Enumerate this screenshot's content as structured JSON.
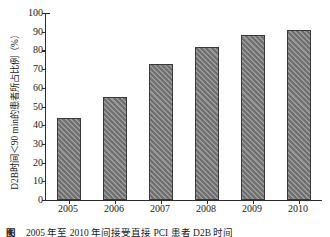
{
  "chart_data": {
    "type": "bar",
    "title": "",
    "xlabel": "",
    "ylabel": "D2B时间＜90 min的患者所占比例（%）",
    "categories": [
      "2005",
      "2006",
      "2007",
      "2008",
      "2009",
      "2010"
    ],
    "values": [
      44,
      55,
      73,
      82,
      88,
      91
    ],
    "ylim": [
      0,
      100
    ],
    "ytick_step": 10,
    "yticks": [
      "0",
      "10",
      "20",
      "30",
      "40",
      "50",
      "60",
      "70",
      "80",
      "90",
      "100"
    ],
    "grid": false,
    "legend": null,
    "series": [
      {
        "name": "D2B时间＜90 min的患者所占比例",
        "values": [
          44,
          55,
          73,
          82,
          88,
          91
        ]
      }
    ],
    "bar_fill_color": "#7d7d7d",
    "bar_edge_color": "#3a3a3a",
    "axis_color": "#2b2b2b",
    "background_color": "#ffffff"
  },
  "caption": {
    "label": "图",
    "text": "2005 年至 2010 年间接受直接 PCI 患者 D2B 时间"
  }
}
